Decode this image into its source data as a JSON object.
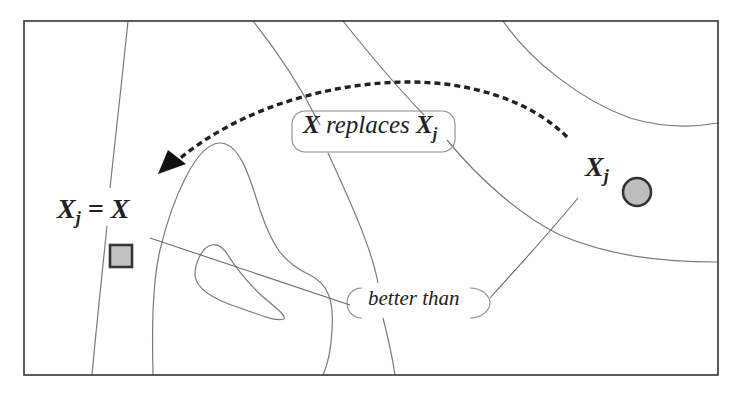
{
  "diagram": {
    "type": "fitness-landscape-contour",
    "frame_color": "#333333",
    "contour_color": "#777777",
    "marker_fill": "#bdbdbd",
    "marker_stroke": "#333333",
    "arrow_color": "#222222"
  },
  "labels": {
    "replaces": {
      "subject": "X",
      "verb": " replaces ",
      "object": "X",
      "object_sub": "j"
    },
    "better_than": "better than",
    "old_solution": {
      "symbol": "X",
      "sub": "j"
    },
    "new_solution": {
      "symbol": "X",
      "sub": "j",
      "equals": " = ",
      "rhs": "X"
    }
  },
  "markers": [
    {
      "name": "new-solution-square",
      "shape": "square"
    },
    {
      "name": "old-solution-circle",
      "shape": "circle"
    }
  ]
}
